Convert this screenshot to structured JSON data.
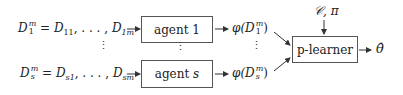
{
  "inputs": [
    {
      "lhs_base": "D",
      "lhs_sup": "m",
      "lhs_sub": "1",
      "eq": " = ",
      "rhs_first_base": "D",
      "rhs_first_sub": "11",
      "sep": ", . . . , ",
      "rhs_last_base": "D",
      "rhs_last_sub": "1m"
    },
    {
      "lhs_base": "D",
      "lhs_sup": "m",
      "lhs_sub": "s",
      "eq": " = ",
      "rhs_first_base": "D",
      "rhs_first_sub": "s1",
      "sep": ", . . . , ",
      "rhs_last_base": "D",
      "rhs_last_sub": "sm"
    }
  ],
  "agents": [
    {
      "label": "agent",
      "index": "1"
    },
    {
      "label": "agent",
      "index": "s"
    }
  ],
  "outputs": [
    {
      "func": "φ(",
      "base": "D",
      "sup": "m",
      "sub": "1",
      "close": ")"
    },
    {
      "func": "φ(",
      "base": "D",
      "sup": "m",
      "sub": "s",
      "close": ")"
    }
  ],
  "vdots": "⋮",
  "learner": {
    "label": "p-learner"
  },
  "learner_inputs": "𝒞, π",
  "result": "θ̂"
}
